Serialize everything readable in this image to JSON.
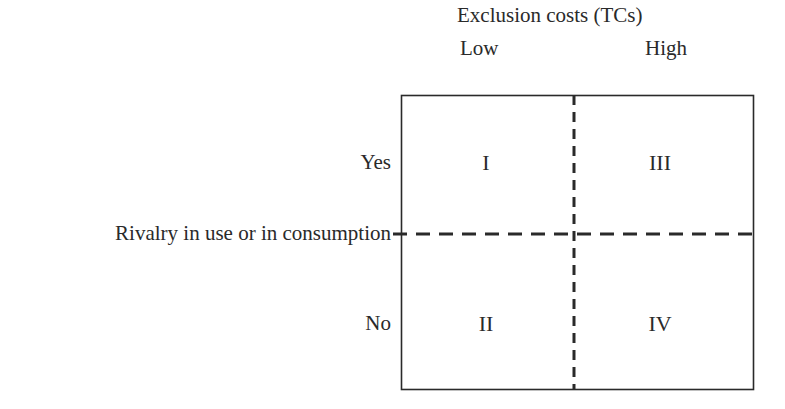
{
  "diagram": {
    "column_axis": {
      "title": "Exclusion costs (TCs)",
      "categories": [
        "Low",
        "High"
      ]
    },
    "row_axis": {
      "title": "Rivalry in use or in consumption",
      "categories": [
        "Yes",
        "No"
      ]
    },
    "quadrants": {
      "yes_low": "I",
      "yes_high": "III",
      "no_low": "II",
      "no_high": "IV"
    },
    "colors": {
      "line": "#2a2a2a",
      "text": "#2a2a2a",
      "background": "#ffffff"
    }
  }
}
